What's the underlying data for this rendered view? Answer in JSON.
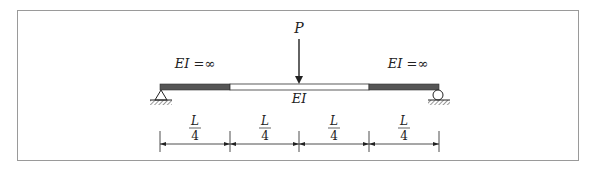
{
  "diagram": {
    "type": "beam",
    "load": {
      "label": "P",
      "position_fraction": 0.5,
      "direction": "down"
    },
    "segments": [
      {
        "label": "EI =∞",
        "stiffness": "infinite",
        "fill": "#555555"
      },
      {
        "label": "EI",
        "stiffness": "finite",
        "fill": "#ffffff"
      },
      {
        "label": "EI =∞",
        "stiffness": "infinite",
        "fill": "#555555"
      }
    ],
    "supports": {
      "left": {
        "type": "pin",
        "icon": "pin-support-icon"
      },
      "right": {
        "type": "roller",
        "icon": "roller-support-icon"
      }
    },
    "dimensions": [
      {
        "num": "L",
        "den": "4"
      },
      {
        "num": "L",
        "den": "4"
      },
      {
        "num": "L",
        "den": "4"
      },
      {
        "num": "L",
        "den": "4"
      }
    ],
    "colors": {
      "line": "#222222",
      "beam_dark": "#555555",
      "frame": "#9a9a9a"
    }
  }
}
